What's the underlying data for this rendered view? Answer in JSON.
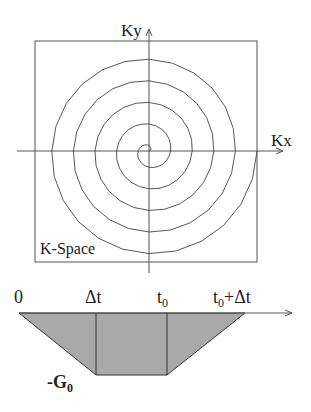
{
  "kspace": {
    "ky_label": "Ky",
    "kx_label": "Kx",
    "box_label": "K-Space",
    "turns": 5
  },
  "gradient": {
    "labels": {
      "zero": "0",
      "dt": "Δt",
      "t0": "t",
      "t0_sub": "0",
      "t0dt_a": "t",
      "t0dt_sub": "0",
      "t0dt_b": "+Δt",
      "g0_prefix": "-G",
      "g0_sub": "0"
    },
    "fill_color": "#a9a9a9"
  }
}
